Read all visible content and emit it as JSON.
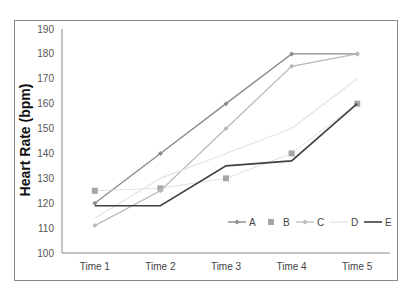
{
  "chart_data": {
    "type": "line",
    "title": "",
    "xlabel": "",
    "ylabel": "Heart Rate (bpm)",
    "categories": [
      "Time 1",
      "Time 2",
      "Time 3",
      "Time 4",
      "Time 5"
    ],
    "ylim": [
      100,
      190
    ],
    "yticks": [
      100,
      110,
      120,
      130,
      140,
      150,
      160,
      170,
      180,
      190
    ],
    "grid": false,
    "legend_position": "bottom-right inside",
    "series": [
      {
        "name": "A",
        "values": [
          120,
          140,
          160,
          180,
          180
        ],
        "color": "#8c8c8c",
        "marker": "diamond",
        "width": 1.4
      },
      {
        "name": "B",
        "values": [
          125,
          126,
          130,
          140,
          160
        ],
        "color": "#a6a6a6",
        "marker": "square",
        "width": 0.8,
        "line_color": "#d9d9d9"
      },
      {
        "name": "C",
        "values": [
          111,
          125,
          150,
          175,
          180
        ],
        "color": "#b8b8b8",
        "marker": "diamond",
        "width": 1.2
      },
      {
        "name": "D",
        "values": [
          114,
          130,
          140,
          150,
          170
        ],
        "color": "#e3e3e3",
        "marker": "none",
        "width": 1.2
      },
      {
        "name": "E",
        "values": [
          119,
          119,
          135,
          137,
          160
        ],
        "color": "#404040",
        "marker": "none",
        "width": 1.6
      }
    ]
  },
  "ylabel_text": "Heart Rate (bpm)"
}
